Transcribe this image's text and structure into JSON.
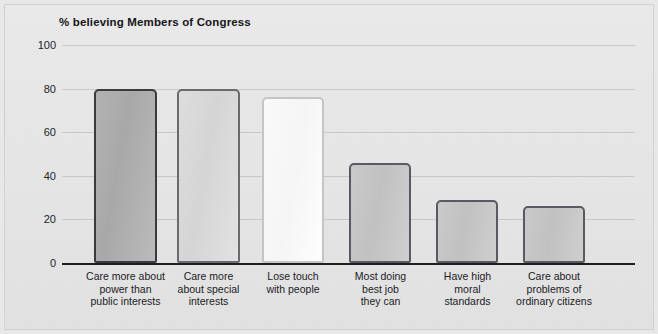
{
  "chart_data": {
    "type": "bar",
    "title": "% believing Members of Congress",
    "xlabel": "",
    "ylabel": "",
    "ylim": [
      0,
      100
    ],
    "yticks": [
      0,
      20,
      40,
      60,
      80,
      100
    ],
    "grid": true,
    "legend": "none",
    "categories": [
      "Care more about\npower than\npublic interests",
      "Care more\nabout special\ninterests",
      "Lose touch\nwith people",
      "Most doing\nbest job\nthey can",
      "Have high\nmoral\nstandards",
      "Care about\nproblems of\nordinary citizens"
    ],
    "values": [
      80,
      80,
      76,
      46,
      29,
      26
    ],
    "bar_colors": [
      "#aeaeae",
      "#dcdcdc",
      "#fbfbfb",
      "#c7c7c7",
      "#c7c7c7",
      "#c7c7c7"
    ],
    "bar_border_colors": [
      "#3a3a3f",
      "#6a6a6f",
      "#c6c6c6",
      "#5a5a60",
      "#5a5a60",
      "#5a5a60"
    ]
  },
  "figure": {
    "background_color": "#e7e7e7",
    "axis_color": "#1d1d20",
    "gridline_color": "#c9c9c9",
    "text_color": "#1b1b1f"
  },
  "axis": {
    "tick_0": "0",
    "tick_20": "20",
    "tick_40": "40",
    "tick_60": "60",
    "tick_80": "80",
    "tick_100": "100"
  }
}
